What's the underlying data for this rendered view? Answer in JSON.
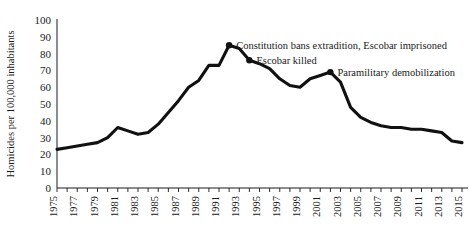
{
  "chart_data": {
    "type": "line",
    "title": "",
    "xlabel": "",
    "ylabel": "Homicides per 100,000 inhabitants",
    "ylim": [
      0,
      100
    ],
    "xlim": [
      1975,
      2015
    ],
    "grid": false,
    "legend": "none",
    "ytick_labels": [
      "100",
      "90",
      "80",
      "70",
      "60",
      "50",
      "40",
      "30",
      "20",
      "10",
      "0"
    ],
    "yticks": [
      100,
      90,
      80,
      70,
      60,
      50,
      40,
      30,
      20,
      10,
      0
    ],
    "xtick_labels": [
      "1975",
      "1977",
      "1979",
      "1981",
      "1983",
      "1985",
      "1987",
      "1989",
      "1991",
      "1993",
      "1995",
      "1997",
      "1999",
      "2001",
      "2003",
      "2005",
      "2007",
      "2009",
      "2011",
      "2013",
      "2015"
    ],
    "xticks": [
      1975,
      1977,
      1979,
      1981,
      1983,
      1985,
      1987,
      1989,
      1991,
      1993,
      1995,
      1997,
      1999,
      2001,
      2003,
      2005,
      2007,
      2009,
      2011,
      2013,
      2015
    ],
    "x": [
      1975,
      1976,
      1977,
      1978,
      1979,
      1980,
      1981,
      1982,
      1983,
      1984,
      1985,
      1986,
      1987,
      1988,
      1989,
      1990,
      1991,
      1992,
      1993,
      1994,
      1995,
      1996,
      1997,
      1998,
      1999,
      2000,
      2001,
      2002,
      2003,
      2004,
      2005,
      2006,
      2007,
      2008,
      2009,
      2010,
      2011,
      2012,
      2013,
      2014,
      2015
    ],
    "values": [
      23,
      24,
      25,
      26,
      27,
      30,
      36,
      34,
      32,
      33,
      38,
      45,
      52,
      60,
      64,
      73,
      73,
      85,
      83,
      76,
      74,
      71,
      65,
      61,
      60,
      65,
      67,
      69,
      63,
      48,
      42,
      39,
      37,
      36,
      36,
      35,
      35,
      34,
      33,
      28,
      27
    ],
    "series": [
      {
        "name": "Homicide rate",
        "color": "#111111",
        "values": [
          23,
          24,
          25,
          26,
          27,
          30,
          36,
          34,
          32,
          33,
          38,
          45,
          52,
          60,
          64,
          73,
          73,
          85,
          83,
          76,
          74,
          71,
          65,
          61,
          60,
          65,
          67,
          69,
          63,
          48,
          42,
          39,
          37,
          36,
          36,
          35,
          35,
          34,
          33,
          28,
          27
        ]
      }
    ],
    "annotations": [
      {
        "id": "constitution-extradition",
        "label": "Constitution bans extradition, Escobar imprisoned",
        "x": 1992,
        "y": 85,
        "marker": true,
        "text_anchor": "start"
      },
      {
        "id": "escobar-killed",
        "label": "Escobar killed",
        "x": 1994,
        "y": 76,
        "marker": true,
        "text_anchor": "start"
      },
      {
        "id": "paramilitary-demobilization",
        "label": "Paramilitary demobilization",
        "x": 2002,
        "y": 69,
        "marker": true,
        "text_anchor": "start"
      }
    ],
    "colors": {
      "line": "#111111",
      "axis": "#1a1a1a",
      "background": "#ffffff",
      "text": "#1a1a1a"
    }
  }
}
